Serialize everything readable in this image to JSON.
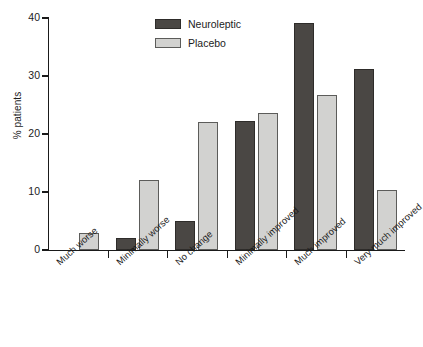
{
  "chart_data": {
    "type": "bar",
    "title": "",
    "xlabel": "",
    "ylabel": "% patients",
    "ylim": [
      0,
      40
    ],
    "yticks": [
      0,
      10,
      20,
      30,
      40
    ],
    "grid": false,
    "legend_position": "top-center",
    "categories": [
      "Much worse",
      "Minimally worse",
      "No change",
      "Minimally improved",
      "Much improved",
      "Very much improved"
    ],
    "series": [
      {
        "name": "Neuroleptic",
        "color": "#4a4744",
        "values": [
          0,
          2.0,
          5.0,
          22.2,
          39.2,
          31.2
        ]
      },
      {
        "name": "Placebo",
        "color": "#d2d2d0",
        "values": [
          3.0,
          12.0,
          22.1,
          23.7,
          26.8,
          10.3
        ]
      }
    ]
  },
  "axis": {
    "y_tick_labels": [
      "0",
      "10",
      "20",
      "30",
      "40"
    ]
  }
}
